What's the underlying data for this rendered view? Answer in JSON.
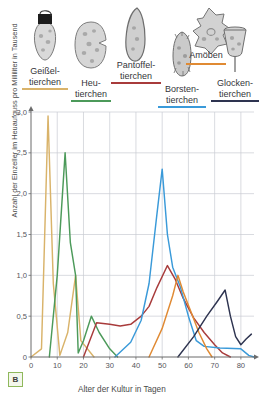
{
  "figure": {
    "panel_label": "B",
    "accent_panel_border": "#8fb85c"
  },
  "organisms": [
    {
      "name": "Geißeltierchen",
      "line1": "Geißel-",
      "line2": "tierchen",
      "color": "#d9b36a",
      "icon": "flagellate-icon"
    },
    {
      "name": "Heutierchen",
      "line1": "Heu-",
      "line2": "tierchen",
      "color": "#4c9a5a",
      "icon": "colpidium-icon"
    },
    {
      "name": "Pantoffeltierchen",
      "line1": "Pantoffel-",
      "line2": "tierchen",
      "color": "#a83b3b",
      "icon": "paramecium-icon"
    },
    {
      "name": "Borstentierchen",
      "line1": "Borsten-",
      "line2": "tierchen",
      "color": "#3a9ad9",
      "icon": "stylonychia-icon"
    },
    {
      "name": "Amöben",
      "line1": "Amöben",
      "line2": "",
      "color": "#e08a33",
      "icon": "amoeba-icon"
    },
    {
      "name": "Glockentierchen",
      "line1": "Glocken-",
      "line2": "tierchen",
      "color": "#2e3450",
      "icon": "vorticella-icon"
    }
  ],
  "chart_data": {
    "type": "line",
    "title": "",
    "xlabel": "Alter der Kultur in Tagen",
    "ylabel": "Anzahl der Einzeller im Heuaufguss pro Milliliter in Tausend",
    "xlim": [
      0,
      85
    ],
    "ylim": [
      0,
      3.0
    ],
    "xticks": [
      0,
      10,
      20,
      30,
      40,
      50,
      60,
      70,
      80
    ],
    "yticks": [
      "0",
      "0,5",
      "1,0",
      "1,5",
      "2,0",
      "2,5",
      "3,0"
    ],
    "ytick_values": [
      0,
      0.5,
      1.0,
      1.5,
      2.0,
      2.5,
      3.0
    ],
    "grid": true,
    "legend": "top-labels",
    "series": [
      {
        "name": "Geißeltierchen",
        "color": "#d9b36a",
        "points": [
          [
            0,
            0
          ],
          [
            4,
            0.1
          ],
          [
            6.5,
            2.95
          ],
          [
            8.5,
            0.9
          ],
          [
            11,
            0.02
          ],
          [
            14,
            0.3
          ],
          [
            17,
            1.0
          ],
          [
            19,
            0.2
          ],
          [
            24,
            0
          ]
        ]
      },
      {
        "name": "Heutierchen",
        "color": "#4c9a5a",
        "points": [
          [
            7,
            0
          ],
          [
            10,
            1.0
          ],
          [
            13,
            2.5
          ],
          [
            15,
            1.4
          ],
          [
            17,
            1.0
          ],
          [
            18,
            0.05
          ],
          [
            20,
            0.2
          ],
          [
            23,
            0.5
          ],
          [
            26,
            0.3
          ],
          [
            30,
            0.1
          ],
          [
            33,
            0
          ]
        ]
      },
      {
        "name": "Pantoffeltierchen",
        "color": "#a83b3b",
        "points": [
          [
            20,
            0
          ],
          [
            23,
            0.25
          ],
          [
            25,
            0.42
          ],
          [
            30,
            0.4
          ],
          [
            34,
            0.38
          ],
          [
            38,
            0.4
          ],
          [
            42,
            0.5
          ],
          [
            45,
            0.62
          ],
          [
            48,
            0.85
          ],
          [
            52,
            1.12
          ],
          [
            55,
            0.95
          ],
          [
            58,
            0.72
          ],
          [
            62,
            0.48
          ],
          [
            66,
            0.3
          ],
          [
            70,
            0.15
          ],
          [
            73,
            0.05
          ],
          [
            76,
            0
          ]
        ]
      },
      {
        "name": "Borstentierchen",
        "color": "#3a9ad9",
        "points": [
          [
            32,
            0
          ],
          [
            38,
            0.18
          ],
          [
            42,
            0.45
          ],
          [
            45,
            0.9
          ],
          [
            48,
            1.75
          ],
          [
            50,
            2.3
          ],
          [
            52,
            1.5
          ],
          [
            54,
            1.1
          ],
          [
            57,
            0.85
          ],
          [
            60,
            0.5
          ],
          [
            63,
            0.2
          ],
          [
            66,
            0.13
          ],
          [
            72,
            0.11
          ],
          [
            80,
            0.1
          ],
          [
            83,
            0.02
          ],
          [
            85,
            0
          ]
        ]
      },
      {
        "name": "Amöben",
        "color": "#e08a33",
        "points": [
          [
            45,
            0
          ],
          [
            50,
            0.35
          ],
          [
            54,
            0.75
          ],
          [
            56,
            1.0
          ],
          [
            58,
            0.8
          ],
          [
            61,
            0.55
          ],
          [
            64,
            0.3
          ],
          [
            67,
            0.1
          ],
          [
            69,
            0
          ]
        ]
      },
      {
        "name": "Glockentierchen",
        "color": "#2e3450",
        "points": [
          [
            56,
            0
          ],
          [
            62,
            0.25
          ],
          [
            67,
            0.5
          ],
          [
            71,
            0.68
          ],
          [
            74,
            0.82
          ],
          [
            76,
            0.5
          ],
          [
            78,
            0.25
          ],
          [
            80,
            0.15
          ],
          [
            82,
            0.22
          ],
          [
            84,
            0.28
          ]
        ]
      }
    ]
  }
}
